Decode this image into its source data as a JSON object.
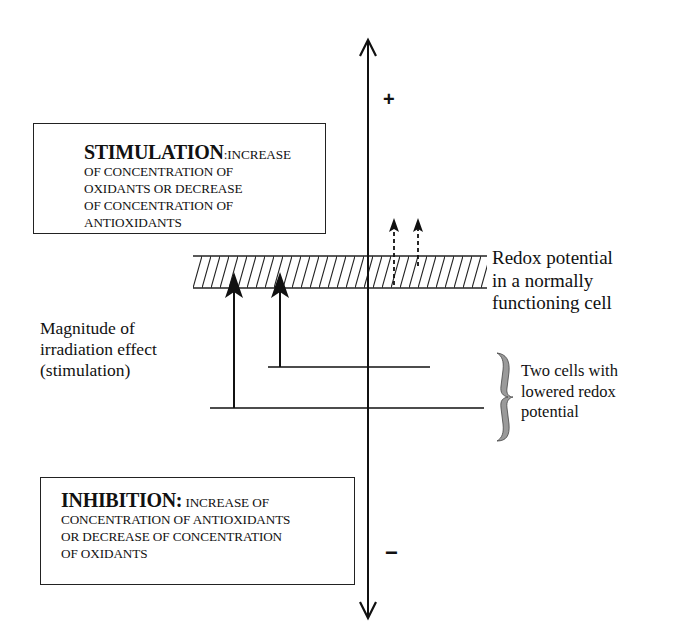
{
  "diagram": {
    "type": "redox-potential-schematic",
    "axis": {
      "orientation": "vertical",
      "top_sign": "+",
      "bottom_sign": "−"
    },
    "stimulation_box": {
      "title": "STIMULATION",
      "title_suffix": ":",
      "lines": [
        "INCREASE",
        "OF CONCENTRATION OF",
        "OXIDANTS OR DECREASE",
        "OF CONCENTRATION OF",
        "ANTIOXIDANTS"
      ]
    },
    "inhibition_box": {
      "title": "INHIBITION:",
      "lines": [
        "INCREASE OF",
        "CONCENTRATION OF ANTIOXIDANTS",
        "OR DECREASE OF CONCENTRATION",
        "OF OXIDANTS"
      ]
    },
    "labels": {
      "normal_redox": "Redox potential\nin a normally\nfunctioning cell",
      "magnitude": "Magnitude of\nirradiation effect\n(stimulation)",
      "two_cells": "Two cells with\nlowered redox\npotential"
    },
    "elements": {
      "hatched_band": {
        "label": "normal redox potential band",
        "fill_pattern": "diagonal-hatch"
      },
      "lowered_levels": [
        "cell 1 lowered redox level (lower line)",
        "cell 2 lowered redox level (upper line)"
      ],
      "solid_arrows": [
        "stimulation effect cell 1",
        "stimulation effect cell 2"
      ],
      "dashed_arrows": [
        "over-stimulation 1",
        "over-stimulation 2"
      ],
      "brace_color": "#9a9a9a"
    },
    "colors": {
      "ink": "#111111",
      "background": "#ffffff",
      "brace_fill": "#9a9a9a"
    }
  }
}
